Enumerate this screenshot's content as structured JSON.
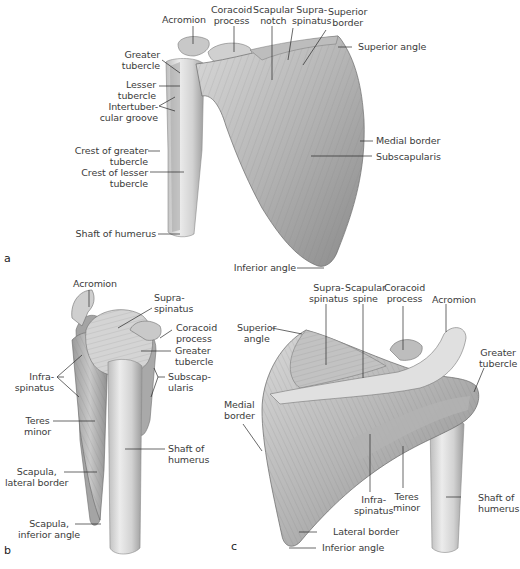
{
  "figure": {
    "panels": [
      {
        "id": "a",
        "letter": "a",
        "view": "anterior",
        "labels": {
          "acromion": "Acromion",
          "coracoid_process": "Coracoid\nprocess",
          "scapular_notch": "Scapular\nnotch",
          "supraspinatus": "Supra-\nspinatus",
          "superior_border": "Superior\nborder",
          "superior_angle": "Superior angle",
          "greater_tubercle": "Greater\ntubercle",
          "lesser_tubercle": "Lesser\ntubercle",
          "intertubercular_groove": "Intertuber-\ncular groove",
          "crest_greater_tubercle": "Crest of greater\ntubercle",
          "crest_lesser_tubercle": "Crest of lesser\ntubercle",
          "shaft_of_humerus": "Shaft of humerus",
          "medial_border": "Medial border",
          "subscapularis": "Subscapularis",
          "inferior_angle": "Inferior angle"
        }
      },
      {
        "id": "b",
        "letter": "b",
        "view": "lateral",
        "labels": {
          "acromion": "Acromion",
          "supraspinatus": "Supra-\nspinatus",
          "coracoid_process": "Coracoid\nprocess",
          "greater_tubercle": "Greater\ntubercle",
          "infraspinatus": "Infra-\nspinatus",
          "subscapularis": "Subscap-\nularis",
          "teres_minor": "Teres\nminor",
          "shaft_of_humerus": "Shaft of\nhumerus",
          "scapula_lateral_border": "Scapula,\nlateral border",
          "scapula_inferior_angle": "Scapula,\ninferior angle"
        }
      },
      {
        "id": "c",
        "letter": "c",
        "view": "posterior",
        "labels": {
          "supraspinatus": "Supra-\nspinatus",
          "scapular_spine": "Scapular\nspine",
          "coracoid_process": "Coracoid\nprocess",
          "acromion": "Acromion",
          "superior_angle": "Superior\nangle",
          "greater_tubercle": "Greater\ntubercle",
          "medial_border": "Medial\nborder",
          "infraspinatus": "Infra-\nspinatus",
          "teres_minor": "Teres\nminor",
          "shaft_of_humerus": "Shaft of\nhumerus",
          "lateral_border": "Lateral border",
          "inferior_angle": "Inferior angle"
        }
      }
    ],
    "colors": {
      "background": "#ffffff",
      "label_text": "#3b3b3b",
      "leader_line": "#2a2a2a",
      "muscle_light": "#d9d9d9",
      "muscle_mid": "#a8a8a8",
      "muscle_dark": "#6e6e6e",
      "bone_light": "#e6e6e6"
    }
  }
}
